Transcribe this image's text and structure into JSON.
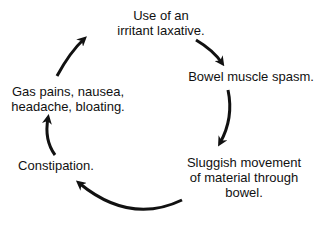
{
  "diagram": {
    "type": "cycle",
    "nodes": [
      {
        "id": "n1",
        "line1": "Use of an",
        "line2": "irritant laxative."
      },
      {
        "id": "n2",
        "line1": "Bowel muscle spasm."
      },
      {
        "id": "n3",
        "line1": "Sluggish movement",
        "line2": "of material through",
        "line3": "bowel."
      },
      {
        "id": "n4",
        "line1": "Constipation."
      },
      {
        "id": "n5",
        "line1": "Gas pains, nausea,",
        "line2": "headache, bloating."
      }
    ],
    "edges": [
      {
        "from": "n1",
        "to": "n2"
      },
      {
        "from": "n2",
        "to": "n3"
      },
      {
        "from": "n3",
        "to": "n4"
      },
      {
        "from": "n4",
        "to": "n5"
      },
      {
        "from": "n5",
        "to": "n1"
      }
    ],
    "colors": {
      "ink": "#111111",
      "background": "#ffffff"
    }
  }
}
